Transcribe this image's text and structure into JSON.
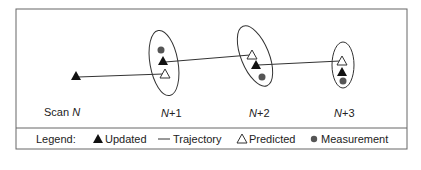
{
  "diagram": {
    "scan_labels": [
      {
        "prefix": "Scan ",
        "var": "N",
        "suffix": ""
      },
      {
        "prefix": "",
        "var": "N",
        "suffix": "+1"
      },
      {
        "prefix": "",
        "var": "N",
        "suffix": "+2"
      },
      {
        "prefix": "",
        "var": "N",
        "suffix": "+3"
      }
    ],
    "legend": {
      "title": "Legend:",
      "items": [
        {
          "icon": "filled-triangle-icon",
          "label": "Updated"
        },
        {
          "icon": "line-icon",
          "label": "Trajectory"
        },
        {
          "icon": "open-triangle-icon",
          "label": "Predicted"
        },
        {
          "icon": "filled-circle-icon",
          "label": "Measurement"
        }
      ]
    },
    "colors": {
      "stroke": "#333333",
      "measurement": "#555555",
      "border": "#666666"
    }
  }
}
